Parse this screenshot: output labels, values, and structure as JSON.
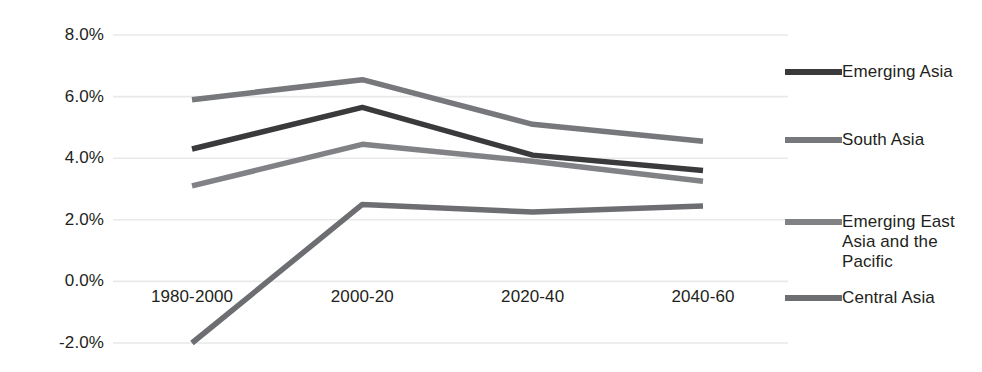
{
  "chart_data": {
    "type": "line",
    "title": "",
    "xlabel": "",
    "ylabel": "",
    "categories": [
      "1980-2000",
      "2000-20",
      "2020-40",
      "2040-60"
    ],
    "ylim": [
      -2.0,
      8.0
    ],
    "ytick_labels": [
      "8.0%",
      "6.0%",
      "4.0%",
      "2.0%",
      "0.0%",
      "-2.0%"
    ],
    "ytick_values": [
      8.0,
      6.0,
      4.0,
      2.0,
      0.0,
      -2.0
    ],
    "grid": true,
    "legend_position": "right",
    "value_suffix": "%",
    "series": [
      {
        "name": "Emerging Asia",
        "color": "#3a3a3c",
        "values": [
          4.3,
          5.65,
          4.1,
          3.6
        ]
      },
      {
        "name": "South Asia",
        "color": "#77787b",
        "values": [
          5.9,
          6.55,
          5.1,
          4.55
        ]
      },
      {
        "name": "Emerging East Asia and the Pacific",
        "color": "#808285",
        "values": [
          3.1,
          4.45,
          3.9,
          3.25
        ]
      },
      {
        "name": "Central Asia",
        "color": "#6d6e71",
        "values": [
          -2.0,
          2.5,
          2.25,
          2.45
        ]
      }
    ]
  },
  "legend": {
    "entries": [
      {
        "label": "Emerging Asia",
        "color": "#3a3a3c"
      },
      {
        "label": "South Asia",
        "color": "#77787b"
      },
      {
        "label": "Emerging East Asia and the Pacific",
        "color": "#808285"
      },
      {
        "label": "Central Asia",
        "color": "#6d6e71"
      }
    ]
  },
  "axis": {
    "y_labels": [
      "8.0%",
      "6.0%",
      "4.0%",
      "2.0%",
      "0.0%",
      "-2.0%"
    ],
    "x_labels": [
      "1980-2000",
      "2000-20",
      "2020-40",
      "2040-60"
    ]
  }
}
